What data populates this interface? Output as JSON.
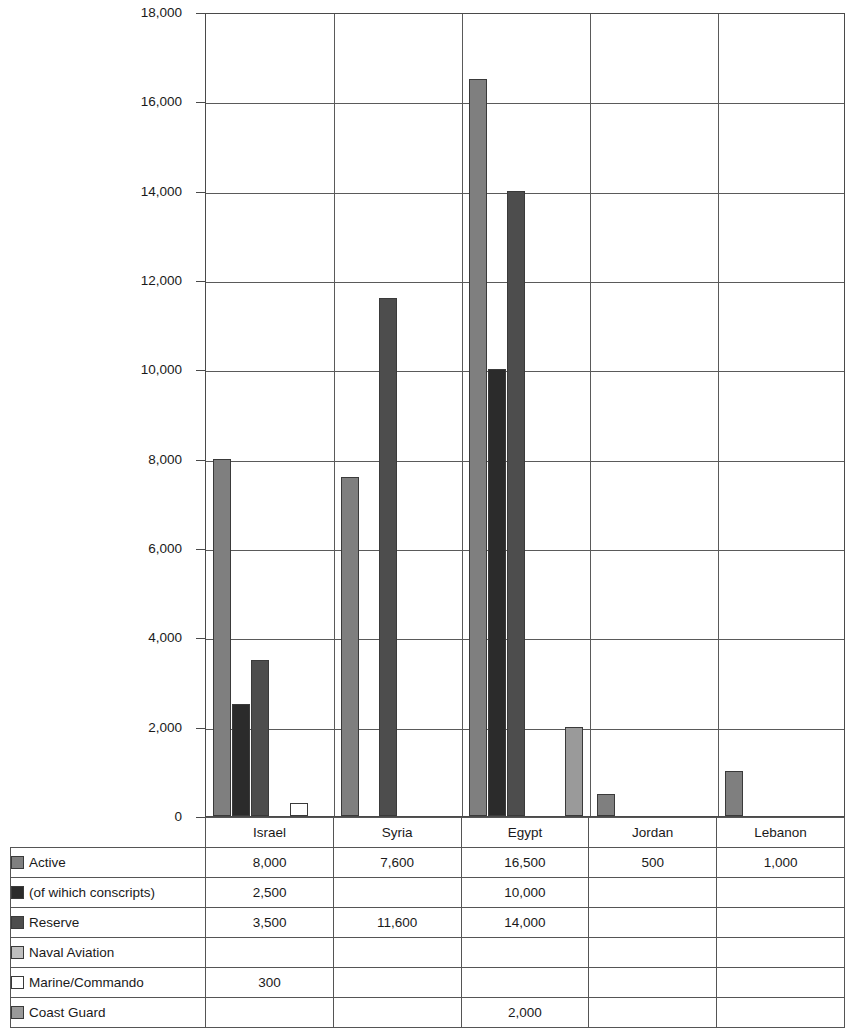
{
  "chart_data": {
    "type": "bar",
    "title": "",
    "subtitle": "",
    "xlabel": "",
    "ylabel": "",
    "ylim": [
      0,
      18000
    ],
    "ytick_step": 2000,
    "yticks": [
      "0",
      "2,000",
      "4,000",
      "6,000",
      "8,000",
      "10,000",
      "12,000",
      "14,000",
      "16,000",
      "18,000"
    ],
    "ytick_values": [
      0,
      2000,
      4000,
      6000,
      8000,
      10000,
      12000,
      14000,
      16000,
      18000
    ],
    "grid": true,
    "legend_position": "bottom-table",
    "categories": [
      "Israel",
      "Syria",
      "Egypt",
      "Jordan",
      "Lebanon"
    ],
    "series": [
      {
        "name": "Active",
        "color": "#7f7f7f",
        "values": [
          8000,
          7600,
          16500,
          500,
          1000
        ],
        "labels": [
          "8,000",
          "7,600",
          "16,500",
          "500",
          "1,000"
        ]
      },
      {
        "name": "(of  wihich conscripts)",
        "color": "#2b2b2b",
        "values": [
          2500,
          null,
          10000,
          null,
          null
        ],
        "labels": [
          "2,500",
          "",
          "10,000",
          "",
          ""
        ]
      },
      {
        "name": "Reserve",
        "color": "#4d4d4d",
        "values": [
          3500,
          11600,
          14000,
          null,
          null
        ],
        "labels": [
          "3,500",
          "11,600",
          "14,000",
          "",
          ""
        ]
      },
      {
        "name": "Naval Aviation",
        "color": "#bfbfbf",
        "values": [
          null,
          null,
          null,
          null,
          null
        ],
        "labels": [
          "",
          "",
          "",
          "",
          ""
        ]
      },
      {
        "name": "Marine/Commando",
        "color": "#ffffff",
        "values": [
          300,
          null,
          null,
          null,
          null
        ],
        "labels": [
          "300",
          "",
          "",
          "",
          ""
        ]
      },
      {
        "name": "Coast Guard",
        "color": "#9a9a9a",
        "values": [
          null,
          null,
          2000,
          null,
          null
        ],
        "labels": [
          "",
          "",
          "2,000",
          "",
          ""
        ]
      }
    ]
  },
  "table": {
    "corner_label": "",
    "column_headers": [
      "Israel",
      "Syria",
      "Egypt",
      "Jordan",
      "Lebanon"
    ],
    "rows": [
      {
        "label": "Active",
        "swatch": "#7f7f7f",
        "cells": [
          "8,000",
          "7,600",
          "16,500",
          "500",
          "1,000"
        ]
      },
      {
        "label": "(of  wihich conscripts)",
        "swatch": "#2b2b2b",
        "cells": [
          "2,500",
          "",
          "10,000",
          "",
          ""
        ]
      },
      {
        "label": "Reserve",
        "swatch": "#4d4d4d",
        "cells": [
          "3,500",
          "11,600",
          "14,000",
          "",
          ""
        ]
      },
      {
        "label": "Naval Aviation",
        "swatch": "#bfbfbf",
        "cells": [
          "",
          "",
          "",
          "",
          ""
        ]
      },
      {
        "label": "Marine/Commando",
        "swatch": "#ffffff",
        "cells": [
          "300",
          "",
          "",
          "",
          ""
        ]
      },
      {
        "label": "Coast Guard",
        "swatch": "#9a9a9a",
        "cells": [
          "",
          "",
          "2,000",
          "",
          ""
        ]
      }
    ]
  },
  "colors": {
    "axis": "#4a4a4a",
    "grid": "#5a5a5a",
    "bar_outline": "#3a3a3a",
    "text": "#1a1a1a",
    "background": "#ffffff"
  }
}
